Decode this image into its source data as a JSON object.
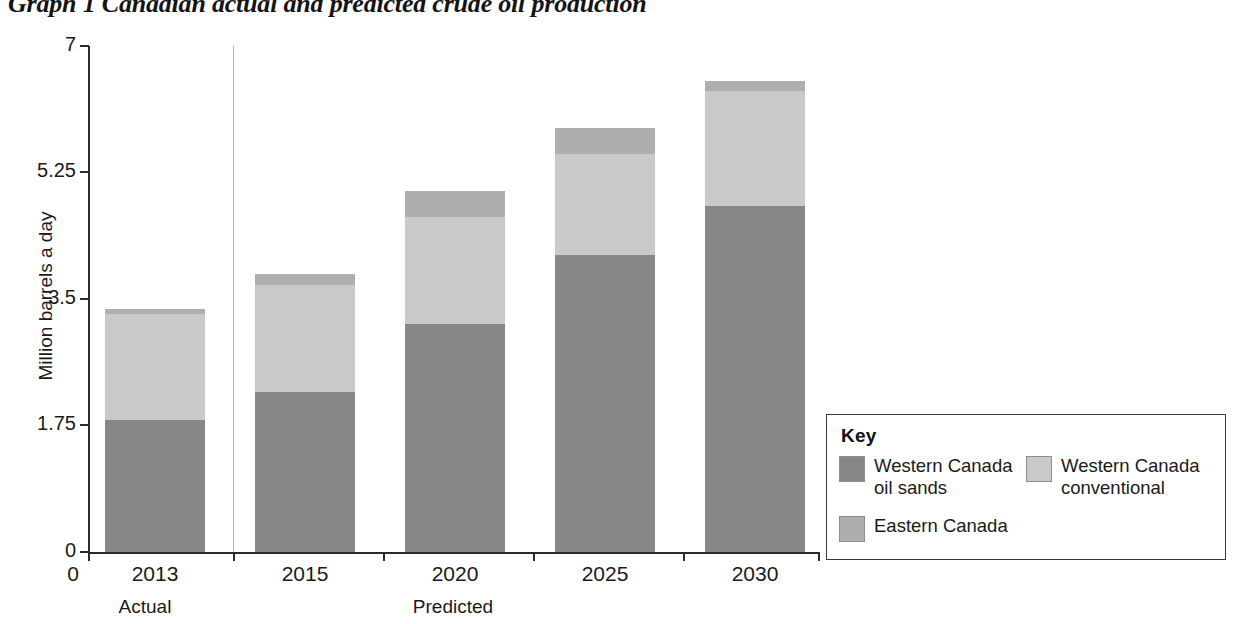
{
  "title": "Graph 1 Canadian actual and predicted crude oil production",
  "axes": {
    "y_title": "Million barrels a day",
    "y_ticks": [
      "0",
      "1.75",
      "3.5",
      "5.25",
      "7"
    ],
    "x_origin": "0",
    "x_ticks": [
      "2013",
      "2015",
      "2020",
      "2025",
      "2030"
    ],
    "x_sublabels": [
      "Actual",
      "Predicted"
    ]
  },
  "key": {
    "title": "Key",
    "items": [
      {
        "label": "Western Canada oil sands",
        "color": "#878787",
        "id": "oilsands"
      },
      {
        "label": "Western Canada conventional",
        "color": "#c9c9c9",
        "id": "conventional"
      },
      {
        "label": "Eastern Canada",
        "color": "#aeaeae",
        "id": "eastern"
      }
    ]
  },
  "chart_data": {
    "type": "bar",
    "stacked": true,
    "title": "Graph 1 Canadian actual and predicted crude oil production",
    "xlabel": "",
    "ylabel": "Million barrels a day",
    "ylim": [
      0,
      7
    ],
    "yticks": [
      0,
      1.75,
      3.5,
      5.25,
      7
    ],
    "grid": false,
    "legend_position": "right-bottom",
    "categories": [
      "2013",
      "2015",
      "2020",
      "2025",
      "2030"
    ],
    "category_groups": [
      {
        "name": "Actual",
        "categories": [
          "2013"
        ]
      },
      {
        "name": "Predicted",
        "categories": [
          "2015",
          "2020",
          "2025",
          "2030"
        ]
      }
    ],
    "series": [
      {
        "name": "Western Canada oil sands",
        "color": "#878787",
        "values": [
          1.82,
          2.22,
          3.16,
          4.11,
          4.79
        ]
      },
      {
        "name": "Western Canada conventional",
        "color": "#c9c9c9",
        "values": [
          1.47,
          1.47,
          1.48,
          1.4,
          1.59
        ]
      },
      {
        "name": "Eastern Canada",
        "color": "#aeaeae",
        "values": [
          0.07,
          0.15,
          0.35,
          0.35,
          0.14
        ]
      }
    ],
    "totals": [
      3.36,
      3.84,
      4.99,
      5.86,
      6.52
    ]
  },
  "geometry": {
    "baseline_y": 552,
    "top_y": 46,
    "px_per_unit": 72.29,
    "bar_width": 100,
    "bar_lefts": [
      105,
      255,
      405,
      555,
      705
    ],
    "divider_x": 233
  }
}
